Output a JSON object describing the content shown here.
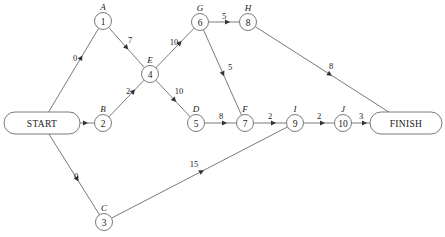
{
  "diagram": {
    "type": "activity-on-node-network",
    "title": "",
    "width": 445,
    "height": 237,
    "colors": {
      "background": "#ffffff",
      "stroke": "#6b6b6b",
      "text": "#1a1a1a",
      "arrow": "#333333"
    }
  },
  "nodes": [
    {
      "id": "start",
      "label": "START",
      "letter": "",
      "x": 42,
      "y": 123,
      "shape": "stadium",
      "rx": 38,
      "ry": 11
    },
    {
      "id": "n1",
      "label": "1",
      "letter": "A",
      "x": 103,
      "y": 21,
      "shape": "circle",
      "r": 8.5
    },
    {
      "id": "n2",
      "label": "2",
      "letter": "B",
      "x": 103,
      "y": 123,
      "shape": "circle",
      "r": 8.5
    },
    {
      "id": "n3",
      "label": "3",
      "letter": "C",
      "x": 104,
      "y": 222,
      "shape": "circle",
      "r": 8.5
    },
    {
      "id": "n4",
      "label": "4",
      "letter": "E",
      "x": 150,
      "y": 74,
      "shape": "circle",
      "r": 8.5
    },
    {
      "id": "n5",
      "label": "5",
      "letter": "D",
      "x": 196,
      "y": 123,
      "shape": "circle",
      "r": 8.5
    },
    {
      "id": "n6",
      "label": "6",
      "letter": "G",
      "x": 200,
      "y": 22,
      "shape": "circle",
      "r": 8.5
    },
    {
      "id": "n7",
      "label": "7",
      "letter": "F",
      "x": 245,
      "y": 123,
      "shape": "circle",
      "r": 8.5
    },
    {
      "id": "n8",
      "label": "8",
      "letter": "H",
      "x": 248,
      "y": 22,
      "shape": "circle",
      "r": 8.5
    },
    {
      "id": "n9",
      "label": "9",
      "letter": "I",
      "x": 295,
      "y": 123,
      "shape": "circle",
      "r": 8.5
    },
    {
      "id": "n10",
      "label": "10",
      "letter": "J",
      "x": 343,
      "y": 123,
      "shape": "circle",
      "r": 8.5
    },
    {
      "id": "finish",
      "label": "FINISH",
      "letter": "",
      "x": 406,
      "y": 123,
      "shape": "stadium",
      "rx": 36,
      "ry": 11
    }
  ],
  "edges": [
    {
      "id": "e-start-1",
      "from": "start",
      "to": "n1",
      "weight": "0",
      "lx": 75,
      "ly": 58
    },
    {
      "id": "e-start-2",
      "from": "start",
      "to": "n2",
      "weight": "0",
      "lx": 72,
      "ly": 115
    },
    {
      "id": "e-start-3",
      "from": "start",
      "to": "n3",
      "weight": "0",
      "lx": 76,
      "ly": 176
    },
    {
      "id": "e-1-4",
      "from": "n1",
      "to": "n4",
      "weight": "7",
      "lx": 130,
      "ly": 40
    },
    {
      "id": "e-2-4",
      "from": "n2",
      "to": "n4",
      "weight": "2",
      "lx": 128,
      "ly": 91
    },
    {
      "id": "e-4-6",
      "from": "n4",
      "to": "n6",
      "weight": "10",
      "lx": 174,
      "ly": 42
    },
    {
      "id": "e-4-5",
      "from": "n4",
      "to": "n5",
      "weight": "10",
      "lx": 179,
      "ly": 91
    },
    {
      "id": "e-6-8",
      "from": "n6",
      "to": "n8",
      "weight": "5",
      "lx": 224,
      "ly": 16
    },
    {
      "id": "e-6-7",
      "from": "n6",
      "to": "n7",
      "weight": "5",
      "lx": 230,
      "ly": 67
    },
    {
      "id": "e-5-7",
      "from": "n5",
      "to": "n7",
      "weight": "8",
      "lx": 221,
      "ly": 116
    },
    {
      "id": "e-7-9",
      "from": "n7",
      "to": "n9",
      "weight": "2",
      "lx": 270,
      "ly": 116
    },
    {
      "id": "e-9-10",
      "from": "n9",
      "to": "n10",
      "weight": "2",
      "lx": 319,
      "ly": 116
    },
    {
      "id": "e-10-finish",
      "from": "n10",
      "to": "finish",
      "weight": "3",
      "lx": 361,
      "ly": 116
    },
    {
      "id": "e-8-finish",
      "from": "n8",
      "to": "finish",
      "weight": "8",
      "lx": 331,
      "ly": 66
    },
    {
      "id": "e-3-9",
      "from": "n3",
      "to": "n9",
      "weight": "15",
      "lx": 194,
      "ly": 164
    }
  ]
}
